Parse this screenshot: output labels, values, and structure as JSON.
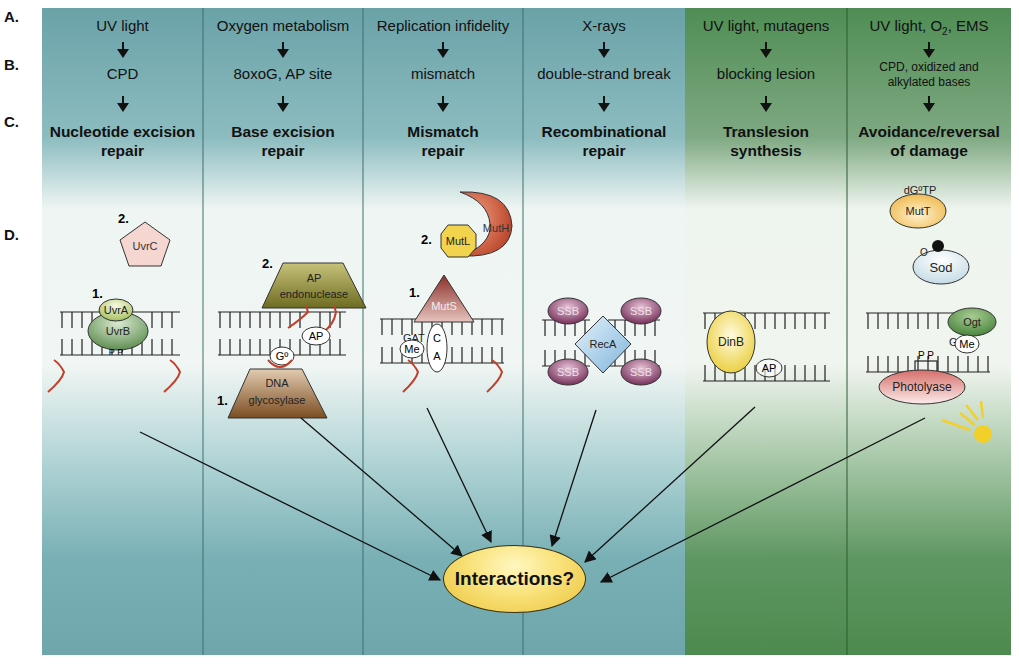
{
  "row_labels": [
    "A.",
    "B.",
    "C.",
    "D."
  ],
  "columns": [
    {
      "cause": "UV light",
      "lesion": "CPD",
      "pathway_line1": "Nucleotide excision",
      "pathway_line2": "repair",
      "theme": "blue"
    },
    {
      "cause": "Oxygen metabolism",
      "lesion": "8oxoG, AP site",
      "pathway_line1": "Base excision",
      "pathway_line2": "repair",
      "theme": "blue"
    },
    {
      "cause": "Replication infidelity",
      "lesion": "mismatch",
      "pathway_line1": "Mismatch",
      "pathway_line2": "repair",
      "theme": "blue"
    },
    {
      "cause": "X-rays",
      "lesion": "double-strand break",
      "pathway_line1": "Recombinational",
      "pathway_line2": "repair",
      "theme": "blue"
    },
    {
      "cause": "UV light, mutagens",
      "lesion": "blocking lesion",
      "pathway_line1": "Translesion",
      "pathway_line2": "synthesis",
      "theme": "green"
    },
    {
      "cause_pre": "UV light, O",
      "cause_sub": "2",
      "cause_post": ", EMS",
      "lesion_line1": "CPD, oxidized and",
      "lesion_line2": "alkylated bases",
      "pathway_line1": "Avoidance/reversal",
      "pathway_line2": "of damage",
      "theme": "green"
    }
  ],
  "proteins": {
    "ner": {
      "step1_label": "1.",
      "step2_label": "2.",
      "uvrA": "UvrA",
      "uvrB": "UvrB",
      "uvrC": "UvrC",
      "dimer": "P P"
    },
    "ber": {
      "step1_label": "1.",
      "step2_label": "2.",
      "ap_endo_line1": "AP",
      "ap_endo_line2": "endonuclease",
      "glyco_line1": "DNA",
      "glyco_line2": "glycosylase",
      "ap_site": "AP",
      "oxoG": "Gº"
    },
    "mmr": {
      "step1_label": "1.",
      "step2_label": "2.",
      "mutS": "MutS",
      "mutL": "MutL",
      "mutH": "MutH",
      "gat": "GAT",
      "me": "Me",
      "mismatch_c": "C",
      "mismatch_a": "A"
    },
    "rec": {
      "recA": "RecA",
      "ssb": "SSB"
    },
    "tls": {
      "dinB": "DinB",
      "ap_site": "AP"
    },
    "avoid": {
      "dGoTP": "dGºTP",
      "mutT": "MutT",
      "o2": "O",
      "o2_sub": "2",
      "sod": "Sod",
      "ogt": "Ogt",
      "g": "G",
      "me": "Me",
      "dimer": "P P",
      "photolyase": "Photolyase"
    }
  },
  "hub_label": "Interactions?",
  "colors": {
    "blue_panel": "#6fa6ab",
    "green_panel": "#4d8a4f",
    "panel_light": "#f2f6f3",
    "dna_lines": "#222222",
    "lesion_red": "#c0402a",
    "uvrC": "#f6d6d0",
    "uvr_green": "#7aa66a",
    "ap_endo": "#7b7a2a",
    "glyco": "#8a5a2e",
    "mutS": "#9b3b33",
    "mutL": "#f2d34d",
    "mutH": "#c9432c",
    "ssb": "#7d2f5a",
    "recA": "#9fc8e4",
    "dinB": "#f2d84a",
    "mutT": "#f3c24e",
    "sod": "#d6e6ec",
    "ogt": "#4e8a3f",
    "photolyase": "#e59a96",
    "sun": "#f3cf2a",
    "hub": "#f5d65a"
  }
}
